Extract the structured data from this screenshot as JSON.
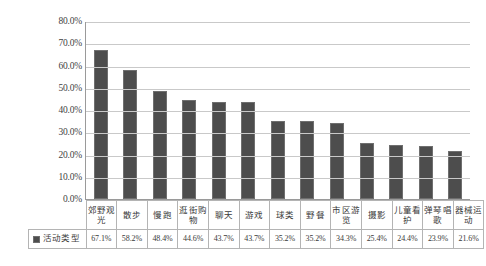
{
  "chart_data": {
    "type": "bar",
    "title": "",
    "subtitle": "",
    "xlabel": "",
    "ylabel": "",
    "ylim": [
      0,
      80
    ],
    "ytick_labels": [
      "80.0%",
      "70.0%",
      "60.0%",
      "50.0%",
      "40.0%",
      "30.0%",
      "20.0%",
      "10.0%",
      "0.0%"
    ],
    "ytick_values": [
      80,
      70,
      60,
      50,
      40,
      30,
      20,
      10,
      0
    ],
    "grid": "horizontal",
    "legend_position": "table-row-left",
    "series": [
      {
        "name": "活动类型",
        "color": "#4d4d4d",
        "values": [
          67.1,
          58.2,
          48.4,
          44.6,
          43.7,
          43.7,
          35.2,
          35.2,
          34.3,
          25.4,
          24.4,
          23.9,
          21.6
        ],
        "value_labels": [
          "67.1%",
          "58.2%",
          "48.4%",
          "44.6%",
          "43.7%",
          "43.7%",
          "35.2%",
          "35.2%",
          "34.3%",
          "25.4%",
          "24.4%",
          "23.9%",
          "21.6%"
        ]
      }
    ],
    "categories": [
      "郊野观光",
      "散步",
      "慢跑",
      "逛街购物",
      "聊天",
      "游戏",
      "球类",
      "野餐",
      "市区游览",
      "摄影",
      "儿童看护",
      "弹琴唱歌",
      "器械运动"
    ]
  },
  "legend": {
    "label": "活动类型",
    "swatch_color": "#4d4d4d",
    "swatch_icon": "square-swatch-icon"
  }
}
